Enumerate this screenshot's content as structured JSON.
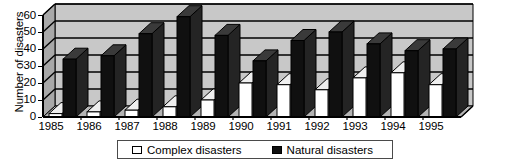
{
  "chart_data": {
    "type": "bar",
    "title": "",
    "subtitle": "",
    "xlabel": "",
    "ylabel": "Number of disasters",
    "categories": [
      "1985",
      "1986",
      "1987",
      "1988",
      "1989",
      "1990",
      "1991",
      "1992",
      "1993",
      "1994",
      "1995"
    ],
    "series": [
      {
        "name": "Complex disasters",
        "color": "#ffffff",
        "values": [
          2,
          3,
          4,
          6,
          10,
          20,
          19,
          16,
          23,
          26,
          19
        ]
      },
      {
        "name": "Natural disasters",
        "color": "#101010",
        "values": [
          34,
          36,
          49,
          59,
          48,
          33,
          45,
          50,
          43,
          39,
          40
        ]
      }
    ],
    "ylim": [
      0,
      60
    ],
    "yticks": [
      0,
      10,
      20,
      30,
      40,
      50,
      60
    ],
    "ytick_labels": [
      "0",
      "10",
      "20",
      "30",
      "40",
      "50",
      "60"
    ],
    "grid": true,
    "grid_axis": "y",
    "legend_position": "bottom",
    "style": "3d-column",
    "plot_background": "#c8c8c8"
  },
  "legend": {
    "entries": [
      {
        "label": "Complex disasters",
        "marker": "hollow-square-icon"
      },
      {
        "label": "Natural disasters",
        "marker": "filled-square-icon"
      }
    ]
  }
}
